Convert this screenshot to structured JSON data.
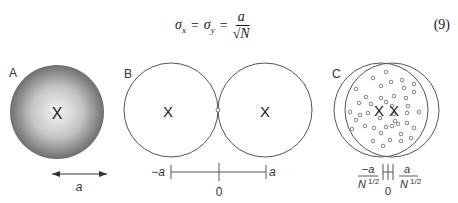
{
  "equation": {
    "lhs1": "σ",
    "lhs1_sub": "x",
    "eq1": "=",
    "lhs2": "σ",
    "lhs2_sub": "y",
    "eq2": "=",
    "numerator": "a",
    "denominator_root": "√",
    "denominator_var": "N",
    "number": "(9)"
  },
  "panels": {
    "A": {
      "label": "A",
      "center_mark": "X",
      "scale_label": "a"
    },
    "B": {
      "label": "B",
      "left_mark": "X",
      "right_mark": "X",
      "axis_left": "−a",
      "axis_center": "0",
      "axis_right": "a"
    },
    "C": {
      "label": "C",
      "mark1": "X",
      "mark2": "X",
      "axis_left_num": "−a",
      "axis_left_den": "N",
      "axis_left_exp": "1/2",
      "axis_center": "0",
      "axis_right_num": "a",
      "axis_right_den": "N",
      "axis_right_exp": "1/2"
    }
  },
  "colors": {
    "line": "#555555",
    "dot": "#666666",
    "sphere_edge": "#6e6e6e",
    "sphere_center": "#f4f4f4"
  }
}
